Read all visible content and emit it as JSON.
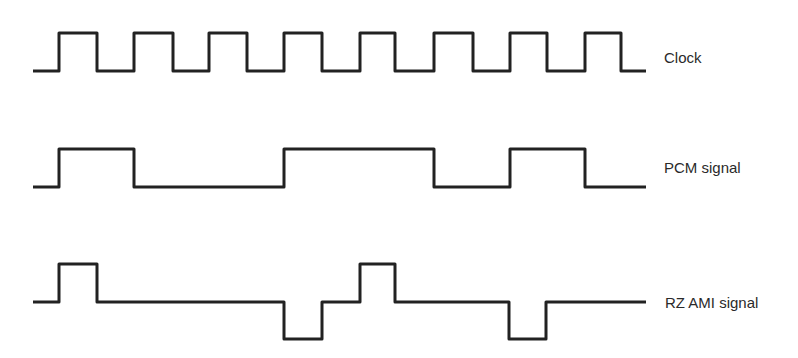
{
  "title": "",
  "signals": [
    {
      "name": "Clock",
      "label_pos": [
        664,
        63
      ],
      "points": [
        [
          33,
          71
        ],
        [
          59,
          71
        ],
        [
          59,
          33
        ],
        [
          97,
          33
        ],
        [
          97,
          71
        ],
        [
          134,
          71
        ],
        [
          134,
          33
        ],
        [
          173,
          33
        ],
        [
          173,
          71
        ],
        [
          209,
          71
        ],
        [
          209,
          33
        ],
        [
          247,
          33
        ],
        [
          247,
          71
        ],
        [
          284,
          71
        ],
        [
          284,
          33
        ],
        [
          322,
          33
        ],
        [
          322,
          71
        ],
        [
          360,
          71
        ],
        [
          360,
          33
        ],
        [
          395,
          33
        ],
        [
          395,
          71
        ],
        [
          434,
          71
        ],
        [
          434,
          33
        ],
        [
          473,
          33
        ],
        [
          473,
          71
        ],
        [
          510,
          71
        ],
        [
          510,
          33
        ],
        [
          547,
          33
        ],
        [
          547,
          71
        ],
        [
          585,
          71
        ],
        [
          585,
          33
        ],
        [
          621,
          33
        ],
        [
          621,
          71
        ],
        [
          646,
          71
        ]
      ],
      "bits": [
        1,
        1,
        1,
        1,
        1,
        1,
        1,
        1
      ]
    },
    {
      "name": "PCM signal",
      "label_pos": [
        664,
        173
      ],
      "points": [
        [
          33,
          187
        ],
        [
          59,
          187
        ],
        [
          59,
          149
        ],
        [
          134,
          149
        ],
        [
          134,
          187
        ],
        [
          284,
          187
        ],
        [
          284,
          149
        ],
        [
          434,
          149
        ],
        [
          434,
          187
        ],
        [
          510,
          187
        ],
        [
          510,
          149
        ],
        [
          585,
          149
        ],
        [
          585,
          187
        ],
        [
          646,
          187
        ]
      ],
      "bits": [
        1,
        1,
        0,
        0,
        1,
        1,
        0,
        1
      ]
    },
    {
      "name": "RZ AMI signal",
      "label_pos": [
        665,
        308
      ],
      "points": [
        [
          33,
          302
        ],
        [
          59,
          302
        ],
        [
          59,
          264
        ],
        [
          97,
          264
        ],
        [
          97,
          302
        ],
        [
          284,
          302
        ],
        [
          284,
          339
        ],
        [
          322,
          339
        ],
        [
          322,
          302
        ],
        [
          360,
          302
        ],
        [
          360,
          264
        ],
        [
          395,
          264
        ],
        [
          395,
          302
        ],
        [
          509,
          302
        ],
        [
          509,
          339
        ],
        [
          546,
          339
        ],
        [
          546,
          302
        ],
        [
          646,
          302
        ]
      ],
      "levels": [
        "+",
        "0",
        "0",
        "-",
        "+",
        "0",
        "0",
        "-"
      ]
    }
  ],
  "chart_data": {
    "type": "line",
    "title": "",
    "xlabel": "",
    "ylabel": "",
    "x": [
      1,
      2,
      3,
      4,
      5,
      6,
      7,
      8
    ],
    "series": [
      {
        "name": "Clock",
        "values": [
          1,
          1,
          1,
          1,
          1,
          1,
          1,
          1
        ]
      },
      {
        "name": "PCM signal",
        "values": [
          1,
          1,
          0,
          0,
          1,
          1,
          0,
          1
        ]
      },
      {
        "name": "RZ AMI signal",
        "values": [
          1,
          0,
          0,
          -1,
          1,
          0,
          0,
          -1
        ]
      }
    ],
    "grid": false,
    "legend_position": "right (inline labels)"
  }
}
